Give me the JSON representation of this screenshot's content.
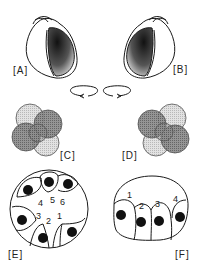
{
  "figure": {
    "panels": [
      {
        "id": "A",
        "label": "[A]",
        "content": "dextral snail shell, aperture on right"
      },
      {
        "id": "B",
        "label": "[B]",
        "content": "sinistral snail shell, aperture on left"
      },
      {
        "id": "C",
        "label": "[C]",
        "content": "4-cell embryo cleavage, clockwise spiral",
        "rotation": "clockwise"
      },
      {
        "id": "D",
        "label": "[D]",
        "content": "4-cell embryo cleavage, counterclockwise spiral",
        "rotation": "counterclockwise"
      },
      {
        "id": "E",
        "label": "[E]",
        "content": "cross-section with six numbered cells",
        "cell_numbers": [
          "1",
          "2",
          "3",
          "4",
          "5",
          "6"
        ]
      },
      {
        "id": "F",
        "label": "[F]",
        "content": "dome section with four numbered cells",
        "cell_numbers": [
          "1",
          "2",
          "3",
          "4"
        ]
      }
    ],
    "colors": {
      "line": "#1a1a1a",
      "dark_cell": "#7a7a7a",
      "light_cell": "#d4d4d4",
      "background": "#ffffff"
    }
  }
}
